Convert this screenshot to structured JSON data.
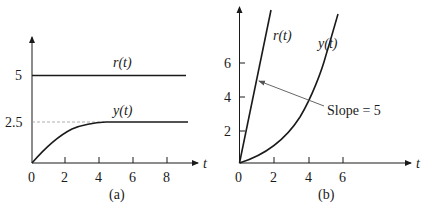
{
  "panels": [
    {
      "caption": "(a)",
      "x_axis_label": "t",
      "x_ticks": [
        "0",
        "2",
        "4",
        "6",
        "8"
      ],
      "y_ticks": [
        "5",
        "2.5"
      ],
      "curves": [
        {
          "label": "r(t)",
          "label_base": "r",
          "label_arg": "t",
          "description": "step input of height 5"
        },
        {
          "label": "y(t)",
          "label_base": "y",
          "label_arg": "t",
          "description": "response rising to 2.5"
        }
      ]
    },
    {
      "caption": "(b)",
      "x_axis_label": "t",
      "x_ticks": [
        "0",
        "2",
        "4",
        "6"
      ],
      "y_ticks": [
        "2",
        "4",
        "6"
      ],
      "curves": [
        {
          "label": "r(t)",
          "label_base": "r",
          "label_arg": "t",
          "description": "ramp input, slope 5"
        },
        {
          "label": "y(t)",
          "label_base": "y",
          "label_arg": "t",
          "description": "ramp response"
        }
      ],
      "annotation": "Slope = 5"
    }
  ],
  "colors": {
    "ink": "#1a1a1a",
    "dashed": "#9a9a9a",
    "background": "#ffffff"
  }
}
